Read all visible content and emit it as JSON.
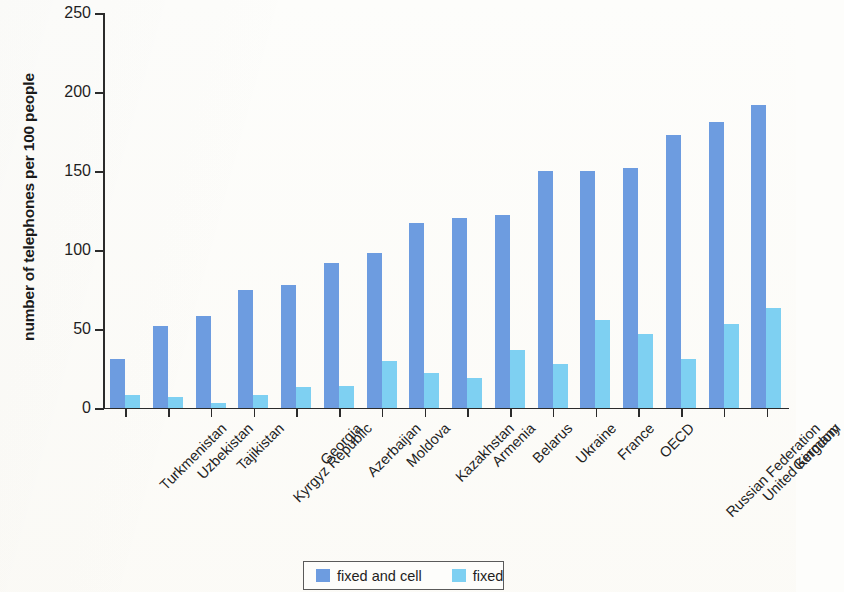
{
  "chart_data": {
    "type": "bar",
    "title": "",
    "xlabel": "",
    "ylabel": "number of telephones per 100 people",
    "ylim": [
      0,
      250
    ],
    "yticks": [
      0,
      50,
      100,
      150,
      200,
      250
    ],
    "grid": false,
    "legend_position": "bottom-center",
    "categories": [
      "Turkmenistan",
      "Uzbekistan",
      "Tajikistan",
      "Kyrgyz Republic",
      "Georgia",
      "Azerbaijan",
      "Moldova",
      "Kazakhstan",
      "Armenia",
      "Belarus",
      "Ukraine",
      "France",
      "OECD",
      "Russian Federation",
      "United Kingdom",
      "Germany"
    ],
    "series": [
      {
        "name": "fixed and cell",
        "color": "#6d9ce0",
        "values": [
          31,
          52,
          58,
          75,
          78,
          92,
          98,
          117,
          120,
          122,
          150,
          150,
          152,
          173,
          181,
          192
        ]
      },
      {
        "name": "fixed",
        "color": "#7ed0f2",
        "values": [
          8,
          7,
          3,
          8,
          13,
          14,
          30,
          22,
          19,
          37,
          28,
          56,
          47,
          31,
          53,
          63
        ]
      }
    ]
  },
  "legend": {
    "items": [
      {
        "label": "fixed and cell",
        "color": "#6d9ce0"
      },
      {
        "label": "fixed",
        "color": "#7ed0f2"
      }
    ]
  },
  "axes": {
    "y_title": "number of telephones per 100 people",
    "y_tick_labels": [
      "0",
      "50",
      "100",
      "150",
      "200",
      "250"
    ]
  }
}
